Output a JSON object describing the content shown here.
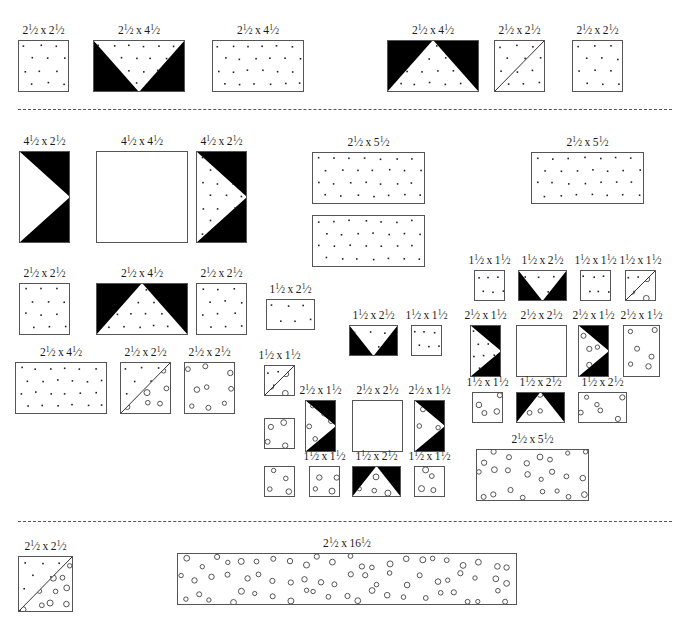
{
  "document": {
    "kind": "quilt-block-cutting-diagram",
    "title": "",
    "sections": 3,
    "colors": {
      "background": "#ffffff",
      "outline": "#555555",
      "dark_fabric": "#000000",
      "light_fabric": "#ffffff",
      "divider": "#555555"
    },
    "legend": {
      "fill_dot": "small-dot-print",
      "fill_circle": "open-circle-print",
      "fill_solid": "solid-black",
      "fill_plain": "plain-white"
    }
  },
  "dividers": [
    {
      "name": "divider-top",
      "y": 109
    },
    {
      "name": "divider-bottom",
      "y": 521
    }
  ],
  "pieces": [
    {
      "id": "p1",
      "label": "2½ x 2½",
      "w": 2.5,
      "h": 2.5,
      "x": 18,
      "y": 40,
      "pw": 51,
      "ph": 52,
      "style": "dot",
      "section": 1
    },
    {
      "id": "p2",
      "label": "2½ x 4½",
      "w": 2.5,
      "h": 4.5,
      "x": 93,
      "y": 40,
      "pw": 92,
      "ph": 52,
      "style": "flyingV-dark-dot",
      "section": 1
    },
    {
      "id": "p3",
      "label": "2½ x 4½",
      "w": 2.5,
      "h": 4.5,
      "x": 212,
      "y": 40,
      "pw": 92,
      "ph": 52,
      "style": "dot",
      "section": 1
    },
    {
      "id": "p4",
      "label": "2½ x 4½",
      "w": 2.5,
      "h": 4.5,
      "x": 387,
      "y": 40,
      "pw": 92,
      "ph": 52,
      "style": "peak-dark-dot",
      "section": 1
    },
    {
      "id": "p5",
      "label": "2½ x 2½",
      "w": 2.5,
      "h": 2.5,
      "x": 494,
      "y": 40,
      "pw": 51,
      "ph": 52,
      "style": "diag-plain-dot",
      "section": 1
    },
    {
      "id": "p6",
      "label": "2½ x 2½",
      "w": 2.5,
      "h": 2.5,
      "x": 572,
      "y": 40,
      "pw": 51,
      "ph": 52,
      "style": "dot",
      "section": 1
    },
    {
      "id": "p7",
      "label": "4½ x 2½",
      "w": 4.5,
      "h": 2.5,
      "x": 19,
      "y": 151,
      "pw": 51,
      "ph": 92,
      "style": "arrow-dark-plain",
      "section": 2
    },
    {
      "id": "p8",
      "label": "4½ x 4½",
      "w": 4.5,
      "h": 4.5,
      "x": 96,
      "y": 151,
      "pw": 92,
      "ph": 92,
      "style": "plain",
      "section": 2
    },
    {
      "id": "p9",
      "label": "4½ x 2½",
      "w": 4.5,
      "h": 2.5,
      "x": 196,
      "y": 151,
      "pw": 51,
      "ph": 92,
      "style": "arrow-dark-dot",
      "section": 2
    },
    {
      "id": "p10",
      "label": "2½ x 5½",
      "w": 2.5,
      "h": 5.5,
      "x": 312,
      "y": 152,
      "pw": 113,
      "ph": 52,
      "style": "dot",
      "section": 2
    },
    {
      "id": "p11",
      "label": "",
      "w": 2.5,
      "h": 5.5,
      "x": 312,
      "y": 215,
      "pw": 113,
      "ph": 52,
      "style": "dot",
      "section": 2
    },
    {
      "id": "p12",
      "label": "2½ x 5½",
      "w": 2.5,
      "h": 5.5,
      "x": 531,
      "y": 152,
      "pw": 113,
      "ph": 52,
      "style": "dot",
      "section": 2
    },
    {
      "id": "p13",
      "label": "2½ x 2½",
      "w": 2.5,
      "h": 2.5,
      "x": 19,
      "y": 283,
      "pw": 51,
      "ph": 52,
      "style": "dot",
      "section": 2
    },
    {
      "id": "p14",
      "label": "2½ x 4½",
      "w": 2.5,
      "h": 4.5,
      "x": 96,
      "y": 283,
      "pw": 92,
      "ph": 52,
      "style": "peak-dark-dot",
      "section": 2
    },
    {
      "id": "p15",
      "label": "2½ x 2½",
      "w": 2.5,
      "h": 2.5,
      "x": 196,
      "y": 283,
      "pw": 51,
      "ph": 52,
      "style": "dot",
      "section": 2
    },
    {
      "id": "p16",
      "label": "2½ x 4½",
      "w": 2.5,
      "h": 4.5,
      "x": 15,
      "y": 362,
      "pw": 92,
      "ph": 52,
      "style": "dot",
      "section": 2
    },
    {
      "id": "p17",
      "label": "2½ x 2½",
      "w": 2.5,
      "h": 2.5,
      "x": 120,
      "y": 362,
      "pw": 51,
      "ph": 52,
      "style": "diag-dot-circle",
      "section": 2
    },
    {
      "id": "p18",
      "label": "2½ x 2½",
      "w": 2.5,
      "h": 2.5,
      "x": 184,
      "y": 362,
      "pw": 51,
      "ph": 52,
      "style": "circle",
      "section": 2
    },
    {
      "id": "p19",
      "label": "1½ x 2½",
      "w": 1.5,
      "h": 2.5,
      "x": 266,
      "y": 299,
      "pw": 49,
      "ph": 31,
      "style": "dot",
      "section": 2
    },
    {
      "id": "p20",
      "label": "1½ x 2½",
      "w": 1.5,
      "h": 2.5,
      "x": 349,
      "y": 325,
      "pw": 49,
      "ph": 31,
      "style": "flyingV-dark-dot",
      "section": 2
    },
    {
      "id": "p21",
      "label": "1½ x 1½",
      "w": 1.5,
      "h": 1.5,
      "x": 411,
      "y": 325,
      "pw": 31,
      "ph": 31,
      "style": "dot",
      "section": 2
    },
    {
      "id": "p22",
      "label": "1½ x 1½",
      "w": 1.5,
      "h": 1.5,
      "x": 264,
      "y": 365,
      "pw": 31,
      "ph": 31,
      "style": "diag-dot-circle",
      "section": 2
    },
    {
      "id": "p23",
      "label": "",
      "w": 1.5,
      "h": 1.5,
      "x": 264,
      "y": 418,
      "pw": 31,
      "ph": 31,
      "style": "circle",
      "section": 2
    },
    {
      "id": "p24",
      "label": "2½ x 1½",
      "w": 2.5,
      "h": 1.5,
      "x": 305,
      "y": 400,
      "pw": 31,
      "ph": 52,
      "style": "arrow-dark-circle",
      "section": 2
    },
    {
      "id": "p25",
      "label": "2½ x 2½",
      "w": 2.5,
      "h": 2.5,
      "x": 352,
      "y": 400,
      "pw": 51,
      "ph": 52,
      "style": "plain",
      "section": 2
    },
    {
      "id": "p26",
      "label": "2½ x 1½",
      "w": 2.5,
      "h": 1.5,
      "x": 414,
      "y": 400,
      "pw": 31,
      "ph": 52,
      "style": "arrow-dark-circle",
      "section": 2
    },
    {
      "id": "p27",
      "label": "",
      "w": 1.5,
      "h": 1.5,
      "x": 264,
      "y": 466,
      "pw": 31,
      "ph": 31,
      "style": "circle",
      "section": 2
    },
    {
      "id": "p28",
      "label": "1½ x 1½",
      "w": 1.5,
      "h": 1.5,
      "x": 309,
      "y": 466,
      "pw": 31,
      "ph": 31,
      "style": "circle",
      "section": 2
    },
    {
      "id": "p29",
      "label": "1½ x 2½",
      "w": 1.5,
      "h": 2.5,
      "x": 352,
      "y": 466,
      "pw": 49,
      "ph": 31,
      "style": "peak-dark-circle",
      "section": 2
    },
    {
      "id": "p30",
      "label": "1½ x 1½",
      "w": 1.5,
      "h": 1.5,
      "x": 414,
      "y": 466,
      "pw": 31,
      "ph": 31,
      "style": "circle",
      "section": 2
    },
    {
      "id": "p31",
      "label": "1½ x 1½",
      "w": 1.5,
      "h": 1.5,
      "x": 474,
      "y": 270,
      "pw": 31,
      "ph": 31,
      "style": "dot",
      "section": 2
    },
    {
      "id": "p32",
      "label": "1½ x 2½",
      "w": 1.5,
      "h": 2.5,
      "x": 518,
      "y": 270,
      "pw": 49,
      "ph": 31,
      "style": "flyingV-dark-dot",
      "section": 2
    },
    {
      "id": "p33",
      "label": "1½ x 1½",
      "w": 1.5,
      "h": 1.5,
      "x": 580,
      "y": 270,
      "pw": 31,
      "ph": 31,
      "style": "dot",
      "section": 2
    },
    {
      "id": "p34",
      "label": "1½ x 1½",
      "w": 1.5,
      "h": 1.5,
      "x": 625,
      "y": 270,
      "pw": 31,
      "ph": 31,
      "style": "diag-dot-circle",
      "section": 2
    },
    {
      "id": "p35",
      "label": "2½ x 1½",
      "w": 2.5,
      "h": 1.5,
      "x": 470,
      "y": 325,
      "pw": 31,
      "ph": 52,
      "style": "arrow-dark-dot",
      "section": 2
    },
    {
      "id": "p36",
      "label": "2½ x 2½",
      "w": 2.5,
      "h": 2.5,
      "x": 516,
      "y": 325,
      "pw": 51,
      "ph": 52,
      "style": "plain",
      "section": 2
    },
    {
      "id": "p37",
      "label": "2½ x 1½",
      "w": 2.5,
      "h": 1.5,
      "x": 578,
      "y": 325,
      "pw": 31,
      "ph": 52,
      "style": "arrow-dark-circle",
      "section": 2
    },
    {
      "id": "p38",
      "label": "2½ x 1½",
      "w": 2.5,
      "h": 1.5,
      "x": 623,
      "y": 325,
      "pw": 37,
      "ph": 52,
      "style": "circle",
      "section": 2
    },
    {
      "id": "p39",
      "label": "1½ x 1½",
      "w": 1.5,
      "h": 1.5,
      "x": 472,
      "y": 392,
      "pw": 31,
      "ph": 31,
      "style": "circle",
      "section": 2
    },
    {
      "id": "p40",
      "label": "1½ x 2½",
      "w": 1.5,
      "h": 2.5,
      "x": 516,
      "y": 392,
      "pw": 49,
      "ph": 31,
      "style": "peak-dark-circle",
      "section": 2
    },
    {
      "id": "p41",
      "label": "1½ x 2½",
      "w": 1.5,
      "h": 2.5,
      "x": 578,
      "y": 392,
      "pw": 49,
      "ph": 31,
      "style": "circle",
      "section": 2
    },
    {
      "id": "p42",
      "label": "2½ x 5½",
      "w": 2.5,
      "h": 5.5,
      "x": 476,
      "y": 449,
      "pw": 113,
      "ph": 52,
      "style": "circle",
      "section": 2
    },
    {
      "id": "p43",
      "label": "2½ x 2½",
      "w": 2.5,
      "h": 2.5,
      "x": 18,
      "y": 556,
      "pw": 55,
      "ph": 56,
      "style": "diag-dot-circle",
      "section": 3
    },
    {
      "id": "p44",
      "label": "2½ x 16½",
      "w": 2.5,
      "h": 16.5,
      "x": 177,
      "y": 553,
      "pw": 340,
      "ph": 52,
      "style": "circle",
      "section": 3
    }
  ]
}
